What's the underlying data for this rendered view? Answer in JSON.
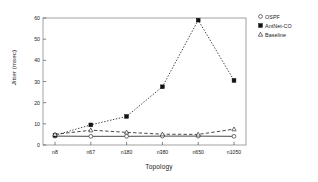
{
  "chart_data": {
    "type": "line",
    "title": "",
    "xlabel": "Topology",
    "ylabel": "Jitter (msec)",
    "categories": [
      "n8",
      "n67",
      "n180",
      "n380",
      "n650",
      "n1050"
    ],
    "ylim": [
      0,
      60
    ],
    "yticks": [
      0,
      10,
      20,
      30,
      40,
      50,
      60
    ],
    "grid": false,
    "legend_position": "outside-top-right",
    "series": [
      {
        "name": "OSPF",
        "marker": "open-circle",
        "linestyle": "solid",
        "color": "#333333",
        "values": [
          4.2,
          4.1,
          4.1,
          4.2,
          4.2,
          4.1
        ]
      },
      {
        "name": "AntNet-CO",
        "marker": "filled-square",
        "linestyle": "dotted",
        "color": "#111111",
        "values": [
          4.6,
          9.5,
          13.5,
          27.5,
          59.0,
          30.5
        ]
      },
      {
        "name": "Baseline",
        "marker": "open-triangle",
        "linestyle": "dashed",
        "color": "#333333",
        "values": [
          5.0,
          7.0,
          6.0,
          5.1,
          5.0,
          7.5
        ]
      }
    ]
  },
  "axes": {
    "x_title": "Topology",
    "y_title": "Jitter (msec)",
    "y_tick_labels": [
      "0",
      "10",
      "20",
      "30",
      "40",
      "50",
      "60"
    ],
    "x_tick_labels": [
      "n8",
      "n67",
      "n180",
      "n380",
      "n650",
      "n1050"
    ]
  },
  "legend": {
    "items": [
      {
        "label": "OSPF",
        "marker": "open-circle-icon"
      },
      {
        "label": "AntNet-CO",
        "marker": "filled-square-icon"
      },
      {
        "label": "Baseline",
        "marker": "open-triangle-icon"
      }
    ]
  },
  "colors": {
    "axis": "#555555",
    "plot_border": "#888888",
    "text": "#1a1a1a",
    "series_dark": "#111111"
  }
}
